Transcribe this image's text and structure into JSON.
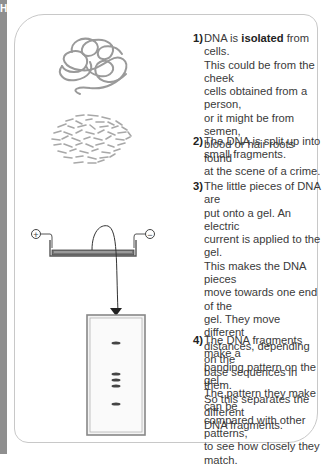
{
  "sidebar": {
    "letter": "H",
    "color": "#8f8f8f"
  },
  "steps": [
    {
      "number": "1)",
      "text_before": "DNA is ",
      "bold": "isolated",
      "text_after": " from cells.\nThis could be from the cheek\ncells obtained from a person,\nor it might be from semen,\nblood or hair roots found\nat the scene of a crime."
    },
    {
      "number": "2)",
      "text": "The DNA is split up into\nsmall fragments."
    },
    {
      "number": "3)",
      "text": "The little pieces of DNA are\nput onto a gel. An electric\ncurrent is applied to the gel.\nThis makes the DNA pieces\nmove towards one end of the\ngel. They move different\ndistances, depending on the\nbase sequences in them.\nSo this separates the different\nDNA fragments."
    },
    {
      "number": "4)",
      "text": "The DNA fragments make a\nbanding pattern on the gel.\nThe pattern they make can be\ncompared with other patterns,\nto see how closely they match."
    }
  ],
  "illustrations": {
    "isolated_dna": "tangled-dna-strand",
    "fragmented_dna": "dna-fragments-cluster",
    "electrophoresis": {
      "positive_terminal": "+",
      "negative_terminal": "−"
    },
    "gel_bands_y": [
      343,
      374,
      380,
      386,
      403
    ]
  }
}
